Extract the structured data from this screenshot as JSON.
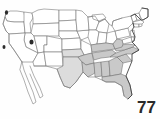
{
  "figure": {
    "name": "united-states-map",
    "page_number": "77",
    "colors": {
      "shaded_fill": "#c9c9c9",
      "shaded_light_fill": "#dcdcdc",
      "unshaded_fill": "#ffffff",
      "state_border": "#6d6d6d",
      "national_outline": "#3a3a3a",
      "page_number_color": "#2a2a2a",
      "background": "#fefefe"
    },
    "shaded_states": [
      "Texas",
      "Oklahoma",
      "Arkansas",
      "Louisiana",
      "Mississippi",
      "Alabama",
      "Tennessee",
      "Kentucky",
      "Georgia",
      "Florida",
      "South Carolina",
      "North Carolina",
      "Virginia",
      "West Virginia"
    ],
    "markers": [
      {
        "name": "marker-utah",
        "x": 31,
        "y": 42
      },
      {
        "name": "marker-california-coast",
        "x": 4,
        "y": 47
      }
    ]
  }
}
